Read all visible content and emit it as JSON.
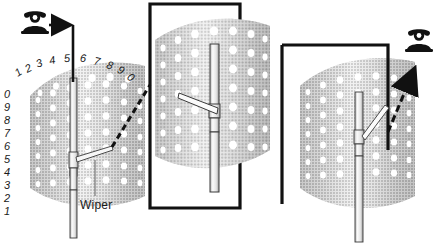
{
  "figure": {
    "background_color": "#ffffff",
    "ink_color": "#1a1a1a",
    "drum_light": "#e6e6e6",
    "drum_mid": "#c9c9c9",
    "drum_dark": "#8e8e8e",
    "hole_color": "#ffffff"
  },
  "panels": [
    {
      "id": "left-overview",
      "name": "bank-overview",
      "has_box": false,
      "telephone": {
        "name": "telephone-icon",
        "position": "top-left"
      },
      "arrow": {
        "name": "incoming-call-arrow",
        "style": "solid",
        "direction": "right-then-down"
      },
      "labels": {
        "wiper": "Wiper"
      },
      "level_numbers_top": [
        "1",
        "2",
        "3",
        "4",
        "5",
        "6",
        "7",
        "8",
        "9",
        "0"
      ],
      "level_numbers_side": [
        "0",
        "9",
        "8",
        "7",
        "6",
        "5",
        "4",
        "3",
        "2",
        "1"
      ]
    },
    {
      "id": "middle-detail",
      "name": "wiper-detail-first",
      "has_box": true,
      "telephone": null,
      "arrow": {
        "name": "magnify-leader-dashed",
        "style": "dashed",
        "direction": "left"
      }
    },
    {
      "id": "right-detail",
      "name": "wiper-detail-second",
      "has_box": true,
      "telephone": {
        "name": "telephone-icon",
        "position": "top-right"
      },
      "arrow": {
        "name": "outgoing-call-arrow",
        "style": "dashed",
        "direction": "up-right"
      }
    }
  ]
}
